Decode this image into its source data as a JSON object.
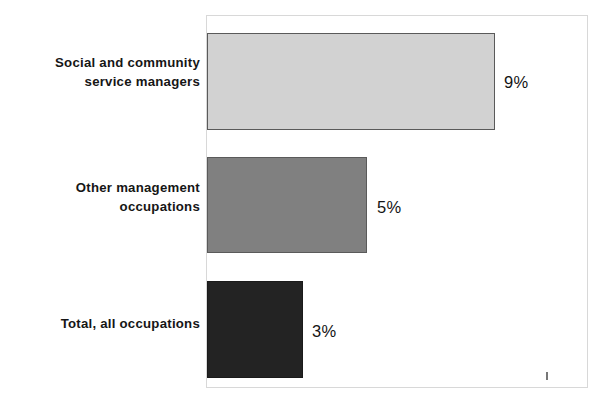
{
  "chart_data": {
    "type": "bar",
    "orientation": "horizontal",
    "title": "",
    "subtitle": "",
    "xlabel": "",
    "ylabel": "",
    "categories": [
      "Social and community service managers",
      "Other management occupations",
      "Total, all occupations"
    ],
    "category_lines": [
      [
        "Social and community",
        "service managers"
      ],
      [
        "Other management",
        "occupations"
      ],
      [
        "Total, all occupations"
      ]
    ],
    "values": [
      9,
      5,
      3
    ],
    "value_labels": [
      "9%",
      "5%",
      "3%"
    ],
    "unit": "%",
    "xlim": [
      0,
      11.9
    ],
    "grid": false,
    "legend": null,
    "bar_colors": [
      "#d2d2d2",
      "#808080",
      "#232323"
    ],
    "bar_border_color": "#5a5a5a",
    "frame_color": "#d8d8d8",
    "text_color": "#161616",
    "background": "#ffffff"
  }
}
